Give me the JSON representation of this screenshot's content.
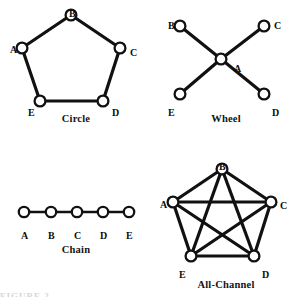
{
  "figure": {
    "background_color": "#ffffff",
    "ink_color": "#111111",
    "node_fill_color": "#ffffff",
    "partial_caption": "FIGURE 2"
  },
  "diagrams": [
    {
      "id": "circle",
      "caption": "Circle",
      "type": "ring",
      "nodes": [
        {
          "label": "A",
          "x": 16,
          "y": 46,
          "label_x": 4,
          "label_y": 44
        },
        {
          "label": "B",
          "x": 65,
          "y": 13,
          "label_x": 63,
          "label_y": 8
        },
        {
          "label": "C",
          "x": 114,
          "y": 46,
          "label_x": 124,
          "label_y": 47
        },
        {
          "label": "D",
          "x": 97,
          "y": 99,
          "label_x": 106,
          "label_y": 107
        },
        {
          "label": "E",
          "x": 34,
          "y": 99,
          "label_x": 22,
          "label_y": 107
        }
      ],
      "edges": [
        [
          "A",
          "B"
        ],
        [
          "B",
          "C"
        ],
        [
          "C",
          "D"
        ],
        [
          "D",
          "E"
        ],
        [
          "E",
          "A"
        ]
      ]
    },
    {
      "id": "wheel",
      "caption": "Wheel",
      "type": "star",
      "nodes": [
        {
          "label": "A",
          "x": 65,
          "y": 57,
          "label_x": 78,
          "label_y": 63
        },
        {
          "label": "B",
          "x": 24,
          "y": 24,
          "label_x": 12,
          "label_y": 20
        },
        {
          "label": "C",
          "x": 108,
          "y": 24,
          "label_x": 118,
          "label_y": 20
        },
        {
          "label": "D",
          "x": 108,
          "y": 92,
          "label_x": 116,
          "label_y": 107
        },
        {
          "label": "E",
          "x": 24,
          "y": 92,
          "label_x": 12,
          "label_y": 107
        }
      ],
      "edges": [
        [
          "A",
          "B"
        ],
        [
          "A",
          "C"
        ],
        [
          "A",
          "D"
        ],
        [
          "A",
          "E"
        ]
      ]
    },
    {
      "id": "chain",
      "caption": "Chain",
      "type": "line",
      "nodes": [
        {
          "label": "A",
          "x": 18,
          "y": 60,
          "label_x": 15,
          "label_y": 80
        },
        {
          "label": "B",
          "x": 45,
          "y": 60,
          "label_x": 42,
          "label_y": 80
        },
        {
          "label": "C",
          "x": 71,
          "y": 60,
          "label_x": 68,
          "label_y": 80
        },
        {
          "label": "D",
          "x": 97,
          "y": 60,
          "label_x": 94,
          "label_y": 80
        },
        {
          "label": "E",
          "x": 123,
          "y": 60,
          "label_x": 120,
          "label_y": 80
        }
      ],
      "edges": [
        [
          "A",
          "B"
        ],
        [
          "B",
          "C"
        ],
        [
          "C",
          "D"
        ],
        [
          "D",
          "E"
        ]
      ]
    },
    {
      "id": "all-channel",
      "caption": "All-Channel",
      "type": "complete",
      "nodes": [
        {
          "label": "A",
          "x": 17,
          "y": 50,
          "label_x": 4,
          "label_y": 49
        },
        {
          "label": "B",
          "x": 66,
          "y": 17,
          "label_x": 63,
          "label_y": 11
        },
        {
          "label": "C",
          "x": 115,
          "y": 50,
          "label_x": 124,
          "label_y": 50
        },
        {
          "label": "D",
          "x": 98,
          "y": 104,
          "label_x": 106,
          "label_y": 119
        },
        {
          "label": "E",
          "x": 35,
          "y": 104,
          "label_x": 23,
          "label_y": 119
        }
      ],
      "edges": [
        [
          "A",
          "B"
        ],
        [
          "B",
          "C"
        ],
        [
          "C",
          "D"
        ],
        [
          "D",
          "E"
        ],
        [
          "E",
          "A"
        ],
        [
          "A",
          "C"
        ],
        [
          "A",
          "D"
        ],
        [
          "B",
          "D"
        ],
        [
          "B",
          "E"
        ],
        [
          "C",
          "E"
        ]
      ]
    }
  ]
}
